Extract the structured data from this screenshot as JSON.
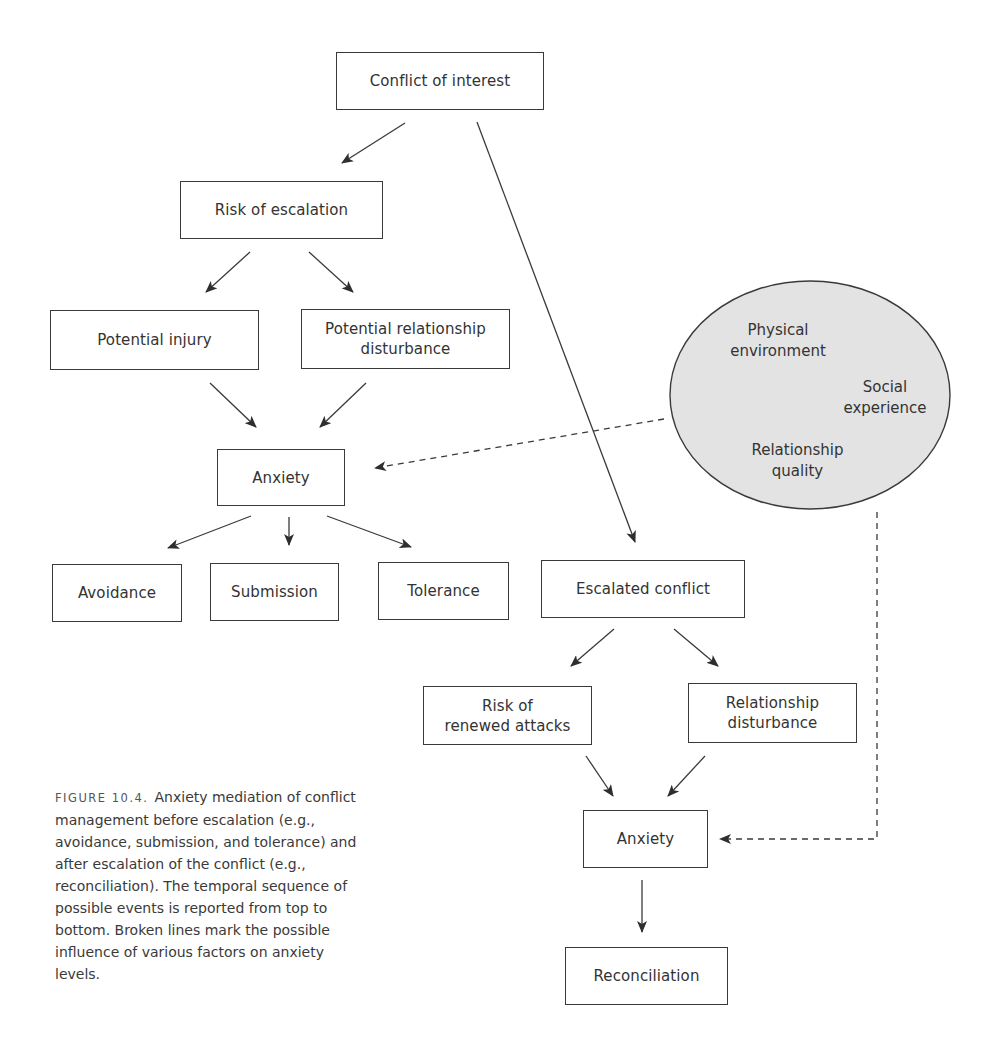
{
  "diagram": {
    "type": "flowchart",
    "nodes": {
      "conflict_of_interest": "Conflict of interest",
      "risk_of_escalation": "Risk of escalation",
      "potential_injury": "Potential injury",
      "potential_relationship_disturbance": "Potential relationship\ndisturbance",
      "anxiety_pre": "Anxiety",
      "avoidance": "Avoidance",
      "submission": "Submission",
      "tolerance": "Tolerance",
      "escalated_conflict": "Escalated conflict",
      "risk_of_renewed_attacks": "Risk of\nrenewed attacks",
      "relationship_disturbance": "Relationship\ndisturbance",
      "anxiety_post": "Anxiety",
      "reconciliation": "Reconciliation"
    },
    "factors": {
      "physical_environment": "Physical\nenvironment",
      "social_experience": "Social\nexperience",
      "relationship_quality": "Relationship\nquality"
    },
    "edges": [
      {
        "from": "Conflict of interest",
        "to": "Risk of escalation",
        "style": "solid"
      },
      {
        "from": "Conflict of interest",
        "to": "Escalated conflict",
        "style": "solid"
      },
      {
        "from": "Risk of escalation",
        "to": "Potential injury",
        "style": "solid"
      },
      {
        "from": "Risk of escalation",
        "to": "Potential relationship disturbance",
        "style": "solid"
      },
      {
        "from": "Potential injury",
        "to": "Anxiety (pre)",
        "style": "solid"
      },
      {
        "from": "Potential relationship disturbance",
        "to": "Anxiety (pre)",
        "style": "solid"
      },
      {
        "from": "Anxiety (pre)",
        "to": "Avoidance",
        "style": "solid"
      },
      {
        "from": "Anxiety (pre)",
        "to": "Submission",
        "style": "solid"
      },
      {
        "from": "Anxiety (pre)",
        "to": "Tolerance",
        "style": "solid"
      },
      {
        "from": "Escalated conflict",
        "to": "Risk of renewed attacks",
        "style": "solid"
      },
      {
        "from": "Escalated conflict",
        "to": "Relationship disturbance",
        "style": "solid"
      },
      {
        "from": "Risk of renewed attacks",
        "to": "Anxiety (post)",
        "style": "solid"
      },
      {
        "from": "Relationship disturbance",
        "to": "Anxiety (post)",
        "style": "solid"
      },
      {
        "from": "Anxiety (post)",
        "to": "Reconciliation",
        "style": "solid"
      },
      {
        "from": "Factors ellipse",
        "to": "Anxiety (pre)",
        "style": "dashed"
      },
      {
        "from": "Factors ellipse",
        "to": "Anxiety (post)",
        "style": "dashed"
      }
    ],
    "colors": {
      "stroke": "#3a3a3a",
      "ellipse_fill": "#e3e3e3",
      "text": "#333333"
    }
  },
  "caption": {
    "label": "FIGURE 10.4.",
    "text": "Anxiety mediation of conflict management before escalation (e.g., avoidance, submission, and tolerance) and after escalation of the conflict (e.g., reconciliation). The temporal sequence of possible events is reported from top to bottom. Broken lines mark the possible influence of various factors on anxiety levels."
  }
}
